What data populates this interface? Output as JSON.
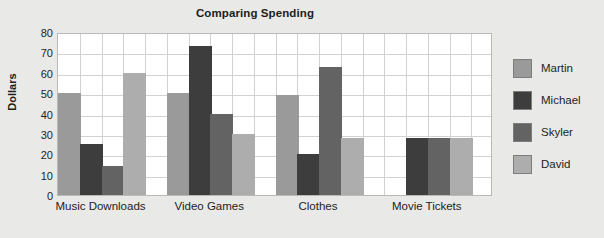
{
  "chart_data": {
    "type": "bar",
    "title": "Comparing Spending",
    "xlabel": "",
    "ylabel": "Dollars",
    "ylim": [
      0,
      80
    ],
    "ytick_step": 10,
    "yticks": [
      80,
      70,
      60,
      50,
      40,
      30,
      20,
      10,
      0
    ],
    "grid": true,
    "legend_position": "right",
    "categories": [
      "Music Downloads",
      "Video Games",
      "Clothes",
      "Movie Tickets"
    ],
    "series": [
      {
        "name": "Martin",
        "color": "#9a9a9a",
        "values": [
          50,
          50,
          49,
          0
        ]
      },
      {
        "name": "Michael",
        "color": "#3d3d3d",
        "values": [
          25,
          73,
          20,
          28
        ]
      },
      {
        "name": "Skyler",
        "color": "#636363",
        "values": [
          14,
          40,
          63,
          28
        ]
      },
      {
        "name": "David",
        "color": "#adadad",
        "values": [
          60,
          30,
          28,
          28
        ]
      }
    ]
  },
  "style": {
    "page_background": "#e9e9e7",
    "plot_background": "#ffffff",
    "gridline_color": "#d2d2d2",
    "axis_border_color": "#b9b9b9",
    "text_color": "#1d1d1d",
    "bar_border_color": "#7d7d7d"
  }
}
